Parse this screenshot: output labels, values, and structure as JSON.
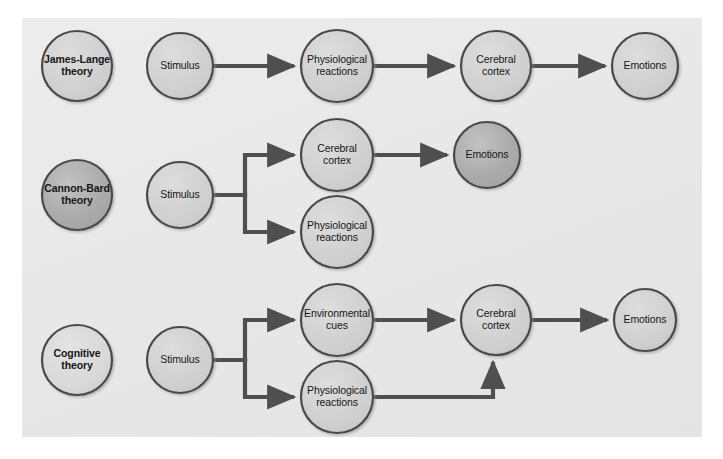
{
  "figure": {
    "background_color": "#ffffff",
    "panel_color": "#e9e9e9",
    "node_fill_default": "#cfcfcf",
    "node_fill_dark": "#a8a8a8",
    "node_fill_light": "#d8d8d8",
    "node_stroke": "#4a4a4a",
    "arrow_color": "#4f4f4f",
    "text_color": "#161616"
  },
  "rows": [
    {
      "id": "james-lange",
      "theory_label": "James-Lange theory",
      "nodes": [
        {
          "id": "jl-theory",
          "label": "James-Lange\ntheory",
          "line1": "James-Lange",
          "line2": "theory",
          "cx": 77,
          "cy": 66,
          "r": 35,
          "fill": "#cfcfcf",
          "bold": true
        },
        {
          "id": "jl-stimulus",
          "label": "Stimulus",
          "line1": "Stimulus",
          "line2": "",
          "cx": 180,
          "cy": 66,
          "r": 33,
          "fill": "#cfcfcf",
          "bold": false
        },
        {
          "id": "jl-physiological",
          "label": "Physiological reactions",
          "line1": "Physiological",
          "line2": "reactions",
          "cx": 337,
          "cy": 66,
          "r": 36,
          "fill": "#cfcfcf",
          "bold": false
        },
        {
          "id": "jl-cortex",
          "label": "Cerebral cortex",
          "line1": "Cerebral",
          "line2": "cortex",
          "cx": 496,
          "cy": 66,
          "r": 35,
          "fill": "#cfcfcf",
          "bold": false
        },
        {
          "id": "jl-emotions",
          "label": "Emotions",
          "line1": "Emotions",
          "line2": "",
          "cx": 645,
          "cy": 66,
          "r": 33,
          "fill": "#cfcfcf",
          "bold": false
        }
      ]
    },
    {
      "id": "cannon-bard",
      "theory_label": "Cannon-Bard theory",
      "nodes": [
        {
          "id": "cb-theory",
          "label": "Cannon-Bard\ntheory",
          "line1": "Cannon-Bard",
          "line2": "theory",
          "cx": 77,
          "cy": 195,
          "r": 35,
          "fill": "#a8a8a8",
          "bold": true
        },
        {
          "id": "cb-stimulus",
          "label": "Stimulus",
          "line1": "Stimulus",
          "line2": "",
          "cx": 180,
          "cy": 195,
          "r": 33,
          "fill": "#cfcfcf",
          "bold": false
        },
        {
          "id": "cb-cortex",
          "label": "Cerebral cortex",
          "line1": "Cerebral",
          "line2": "cortex",
          "cx": 337,
          "cy": 155,
          "r": 36,
          "fill": "#cfcfcf",
          "bold": false
        },
        {
          "id": "cb-physiological",
          "label": "Physiological reactions",
          "line1": "Physiological",
          "line2": "reactions",
          "cx": 337,
          "cy": 232,
          "r": 36,
          "fill": "#cfcfcf",
          "bold": false
        },
        {
          "id": "cb-emotions",
          "label": "Emotions",
          "line1": "Emotions",
          "line2": "",
          "cx": 487,
          "cy": 155,
          "r": 33,
          "fill": "#a8a8a8",
          "bold": false
        }
      ]
    },
    {
      "id": "cognitive",
      "theory_label": "Cognitive theory",
      "nodes": [
        {
          "id": "cg-theory",
          "label": "Cognitive\ntheory",
          "line1": "Cognitive",
          "line2": "theory",
          "cx": 77,
          "cy": 360,
          "r": 35,
          "fill": "#d8d8d8",
          "bold": true
        },
        {
          "id": "cg-stimulus",
          "label": "Stimulus",
          "line1": "Stimulus",
          "line2": "",
          "cx": 180,
          "cy": 360,
          "r": 33,
          "fill": "#cfcfcf",
          "bold": false
        },
        {
          "id": "cg-environmental",
          "label": "Environmental cues",
          "line1": "Environmental",
          "line2": "cues",
          "cx": 337,
          "cy": 320,
          "r": 36,
          "fill": "#cfcfcf",
          "bold": false
        },
        {
          "id": "cg-physiological",
          "label": "Physiological reactions",
          "line1": "Physiological",
          "line2": "reactions",
          "cx": 337,
          "cy": 397,
          "r": 36,
          "fill": "#cfcfcf",
          "bold": false
        },
        {
          "id": "cg-cortex",
          "label": "Cerebral cortex",
          "line1": "Cerebral",
          "line2": "cortex",
          "cx": 496,
          "cy": 320,
          "r": 35,
          "fill": "#cfcfcf",
          "bold": false
        },
        {
          "id": "cg-emotions",
          "label": "Emotions",
          "line1": "Emotions",
          "line2": "",
          "cx": 645,
          "cy": 320,
          "r": 31,
          "fill": "#cfcfcf",
          "bold": false
        }
      ]
    }
  ],
  "connections": [
    {
      "id": "jl-1",
      "from": "jl-stimulus",
      "to": "jl-physiological",
      "type": "straight"
    },
    {
      "id": "jl-2",
      "from": "jl-physiological",
      "to": "jl-cortex",
      "type": "straight"
    },
    {
      "id": "jl-3",
      "from": "jl-cortex",
      "to": "jl-emotions",
      "type": "straight"
    },
    {
      "id": "cb-1",
      "from": "cb-stimulus",
      "to": "cb-cortex",
      "type": "branch-up"
    },
    {
      "id": "cb-2",
      "from": "cb-stimulus",
      "to": "cb-physiological",
      "type": "branch-down"
    },
    {
      "id": "cb-3",
      "from": "cb-cortex",
      "to": "cb-emotions",
      "type": "straight"
    },
    {
      "id": "cg-1",
      "from": "cg-stimulus",
      "to": "cg-environmental",
      "type": "branch-up"
    },
    {
      "id": "cg-2",
      "from": "cg-stimulus",
      "to": "cg-physiological",
      "type": "branch-down"
    },
    {
      "id": "cg-3",
      "from": "cg-environmental",
      "to": "cg-cortex",
      "type": "straight"
    },
    {
      "id": "cg-4",
      "from": "cg-physiological",
      "to": "cg-cortex",
      "type": "elbow-up"
    },
    {
      "id": "cg-5",
      "from": "cg-cortex",
      "to": "cg-emotions",
      "type": "straight"
    }
  ]
}
